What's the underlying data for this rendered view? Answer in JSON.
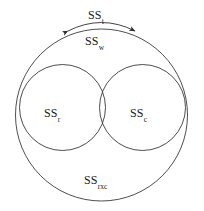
{
  "figure": {
    "type": "venn-diagram",
    "background_color": "#ffffff",
    "stroke_color": "#3a3a3a",
    "text_color": "#1a1a1a"
  },
  "labels": {
    "total": {
      "base": "SS",
      "sub": "t",
      "full": "SSt"
    },
    "within": {
      "base": "SS",
      "sub": "w",
      "full": "SSw"
    },
    "rows": {
      "base": "SS",
      "sub": "r",
      "full": "SSr"
    },
    "columns": {
      "base": "SS",
      "sub": "c",
      "full": "SSc"
    },
    "interaction": {
      "base": "SS",
      "sub": "rxc",
      "full": "SSrxc"
    }
  },
  "shapes": {
    "outer_circle": {
      "cx": 101.5,
      "cy": 115,
      "r": 86
    },
    "left_circle": {
      "cx": 62.5,
      "cy": 107.5,
      "r": 43
    },
    "right_circle": {
      "cx": 142.5,
      "cy": 107.5,
      "r": 43
    }
  },
  "annotations": {
    "brace_arc": {
      "from_x": 66,
      "from_y": 32,
      "to_x": 137,
      "to_y": 32,
      "peak_y": 20
    },
    "arrow_left": {
      "x": 66,
      "y": 32
    },
    "arrow_right": {
      "x": 137,
      "y": 32
    }
  }
}
